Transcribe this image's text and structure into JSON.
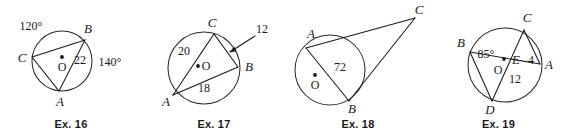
{
  "figures": [
    {
      "id": "ex16",
      "caption": "Ex. 16",
      "description": "Circle with center O and inscribed triangle ABC; arcs labeled 120 degrees and 140 degrees, chord segment labeled 22",
      "center_label": "O",
      "points": [
        {
          "name": "point-b",
          "label": "B"
        },
        {
          "name": "point-c",
          "label": "C"
        },
        {
          "name": "point-a",
          "label": "A"
        }
      ],
      "measures": [
        {
          "name": "arc-cb-measure",
          "label": "120°"
        },
        {
          "name": "arc-ba-measure",
          "label": "140°"
        },
        {
          "name": "chord-ba-measure",
          "label": "22"
        }
      ]
    },
    {
      "id": "ex17",
      "caption": "Ex. 17",
      "description": "Circle with center O and inscribed triangle ABC; chord AC labeled 20, chord AB labeled 18, chord CB labeled 12 with leader arrow",
      "center_label": "O",
      "points": [
        {
          "name": "point-c",
          "label": "C"
        },
        {
          "name": "point-b",
          "label": "B"
        },
        {
          "name": "point-a",
          "label": "A"
        }
      ],
      "measures": [
        {
          "name": "chord-ac-measure",
          "label": "20"
        },
        {
          "name": "chord-ab-measure",
          "label": "18"
        },
        {
          "name": "chord-cb-measure",
          "label": "12"
        }
      ]
    },
    {
      "id": "ex18",
      "caption": "Ex. 18",
      "description": "Circle with center O, chord AB labeled 72, and exterior point C with two tangent-like secants from A and B",
      "center_label": "O",
      "points": [
        {
          "name": "point-a",
          "label": "A"
        },
        {
          "name": "point-c",
          "label": "C"
        },
        {
          "name": "point-b",
          "label": "B"
        }
      ],
      "measures": [
        {
          "name": "arc-ab-measure",
          "label": "72"
        }
      ]
    },
    {
      "id": "ex19",
      "caption": "Ex. 19",
      "description": "Circle with center O, two intersecting chords BA and CD crossing at point E; angle at E labeled 85 degrees, segment EA labeled 4, segment ED labeled 12",
      "center_label": "O",
      "points": [
        {
          "name": "point-c",
          "label": "C"
        },
        {
          "name": "point-b",
          "label": "B"
        },
        {
          "name": "point-a",
          "label": "A"
        },
        {
          "name": "point-e",
          "label": "E"
        },
        {
          "name": "point-d",
          "label": "D"
        }
      ],
      "measures": [
        {
          "name": "angle-e-measure",
          "label": "85°"
        },
        {
          "name": "segment-ea-measure",
          "label": "4"
        },
        {
          "name": "segment-ed-measure",
          "label": "12"
        }
      ]
    }
  ]
}
